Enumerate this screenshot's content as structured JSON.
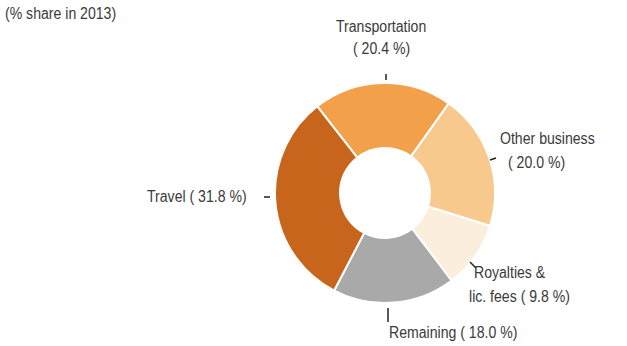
{
  "subtitle": "(% share in 2013)",
  "chart_data": {
    "type": "pie",
    "subtype": "donut",
    "title": "",
    "subtitle": "(% share in 2013)",
    "categories": [
      "Transportation",
      "Other business",
      "Royalties & lic. fees",
      "Remaining",
      "Travel"
    ],
    "values": [
      20.4,
      20.0,
      9.8,
      18.0,
      31.8
    ],
    "colors": [
      "#f2a04a",
      "#f7c98c",
      "#fbeedd",
      "#a9a9a9",
      "#c8651c"
    ],
    "legend": "none (direct labels)"
  },
  "labels": {
    "transportation_line1": "Transportation",
    "transportation_line2": "( 20.4 %)",
    "other_line1": "Other business",
    "other_line2": "( 20.0 %)",
    "royalties_line1": "Royalties &",
    "royalties_line2": "lic. fees (  9.8 %)",
    "remaining": "Remaining ( 18.0 %)",
    "travel": "Travel ( 31.8 %)"
  }
}
